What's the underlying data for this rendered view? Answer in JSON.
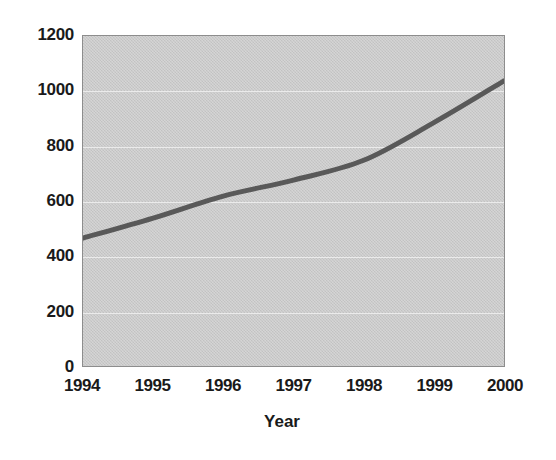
{
  "chart_data": {
    "type": "line",
    "title": "",
    "xlabel": "Year",
    "ylabel": "",
    "categories": [
      "1994",
      "1995",
      "1996",
      "1997",
      "1998",
      "1999",
      "2000"
    ],
    "x": [
      1994,
      1995,
      1996,
      1997,
      1998,
      1999,
      2000
    ],
    "values": [
      465,
      538,
      618,
      676,
      748,
      885,
      1037
    ],
    "series": [
      {
        "name": "",
        "values": [
          465,
          538,
          618,
          676,
          748,
          885,
          1037
        ]
      }
    ],
    "ylim": [
      0,
      1200
    ],
    "xlim": [
      1994,
      2000
    ],
    "ytick_labels": [
      "0",
      "200",
      "400",
      "600",
      "800",
      "1000",
      "1200"
    ],
    "ytick_values": [
      0,
      200,
      400,
      600,
      800,
      1000,
      1200
    ],
    "xtick_labels": [
      "1994",
      "1995",
      "1996",
      "1997",
      "1998",
      "1999",
      "2000"
    ],
    "grid": true,
    "legend": false,
    "legend_position": "none",
    "colors": {
      "line": "#595959",
      "plot_background": "#c9c9c9",
      "grid": "#ebebeb",
      "axis_border": "#8d8d8d",
      "text": "#1a1a1a",
      "figure_background": "#ffffff"
    },
    "line_width_px": 5,
    "smoothing": "smooth"
  }
}
